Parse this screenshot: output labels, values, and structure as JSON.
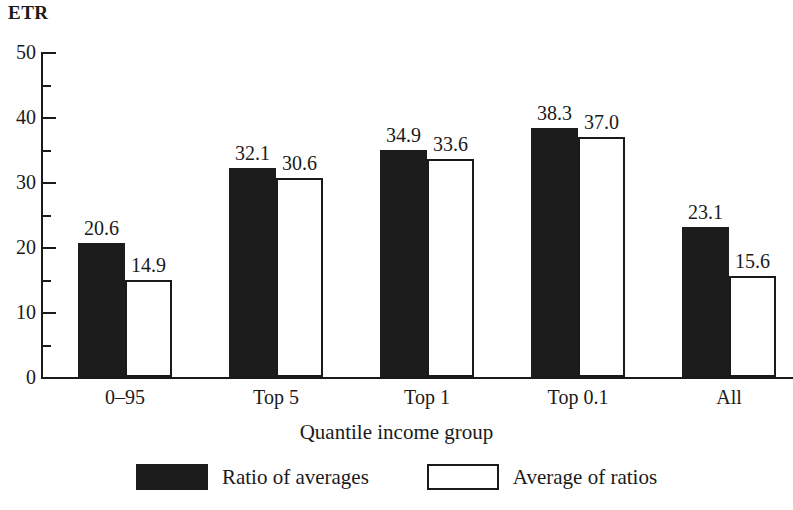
{
  "chart_data": {
    "type": "bar",
    "title": "",
    "subtitle": "",
    "xlabel": "Quantile income group",
    "ylabel": "ETR",
    "ylim": [
      0,
      50
    ],
    "y_major_ticks": [
      0,
      10,
      20,
      30,
      40,
      50
    ],
    "y_minor_ticks": [
      5,
      15,
      25,
      35,
      45
    ],
    "y_tick_labels": [
      "0",
      "10",
      "20",
      "30",
      "40",
      "50"
    ],
    "grid": false,
    "legend_position": "bottom",
    "categories": [
      "0–95",
      "Top 5",
      "Top 1",
      "Top 0.1",
      "All"
    ],
    "series": [
      {
        "name": "Ratio of averages",
        "style": "filled",
        "color": "#1c1c1c",
        "values": [
          20.6,
          32.1,
          34.9,
          38.3,
          23.1
        ],
        "labels": [
          "20.6",
          "32.1",
          "34.9",
          "38.3",
          "23.1"
        ]
      },
      {
        "name": "Average of ratios",
        "style": "hollow",
        "color": "#ffffff",
        "edge_color": "#1a1a1a",
        "values": [
          14.9,
          30.6,
          33.6,
          37.0,
          15.6
        ],
        "labels": [
          "14.9",
          "30.6",
          "33.6",
          "37.0",
          "15.6"
        ]
      }
    ]
  },
  "legend": {
    "entries": [
      {
        "label": "Ratio of averages"
      },
      {
        "label": "Average of ratios"
      }
    ]
  }
}
